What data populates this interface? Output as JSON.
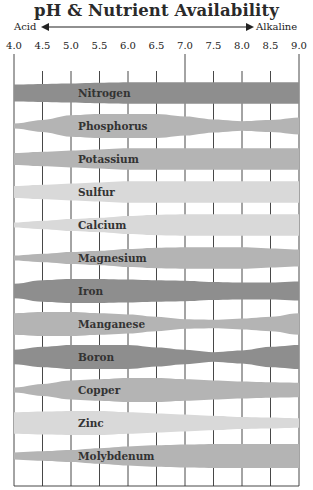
{
  "title": "pH & Nutrient Availability",
  "axis": {
    "left_label": "Acid",
    "right_label": "Alkaline",
    "ticks": [
      "4.0",
      "4.5",
      "5.0",
      "5.5",
      "6.0",
      "6.5",
      "7.0",
      "7.5",
      "8.0",
      "8.5",
      "9.0"
    ]
  },
  "colors": {
    "dark": "#8e8e8e",
    "medium": "#b4b4b4",
    "light": "#d9d9d9",
    "grid": "#333333"
  },
  "chart_data": {
    "type": "area",
    "title": "pH & Nutrient Availability",
    "xlabel": "pH (Acid ← → Alkaline)",
    "x_ticks": [
      4.0,
      4.5,
      5.0,
      5.5,
      6.0,
      6.5,
      7.0,
      7.5,
      8.0,
      8.5,
      9.0
    ],
    "xlim": [
      4.0,
      9.0
    ],
    "grid": true,
    "x": [
      4.0,
      4.5,
      5.0,
      5.5,
      6.0,
      6.5,
      7.0,
      7.5,
      8.0,
      8.5,
      9.0
    ],
    "series": [
      {
        "name": "Nitrogen",
        "shade": "dark",
        "values": [
          0.7,
          0.75,
          0.8,
          0.85,
          0.9,
          0.9,
          0.9,
          0.9,
          0.9,
          0.9,
          0.9
        ]
      },
      {
        "name": "Phosphorus",
        "shade": "medium",
        "values": [
          0.2,
          0.5,
          0.9,
          1.0,
          1.0,
          1.0,
          0.8,
          0.55,
          0.4,
          0.5,
          0.7
        ]
      },
      {
        "name": "Potassium",
        "shade": "medium",
        "values": [
          0.5,
          0.6,
          0.7,
          0.8,
          0.9,
          0.9,
          0.9,
          0.9,
          0.9,
          0.9,
          0.9
        ]
      },
      {
        "name": "Sulfur",
        "shade": "light",
        "values": [
          0.5,
          0.6,
          0.7,
          0.8,
          0.9,
          0.9,
          0.9,
          0.9,
          0.9,
          0.9,
          0.9
        ]
      },
      {
        "name": "Calcium",
        "shade": "light",
        "values": [
          0.2,
          0.35,
          0.5,
          0.6,
          0.75,
          0.85,
          0.9,
          0.9,
          0.9,
          0.9,
          0.9
        ]
      },
      {
        "name": "Magnesium",
        "shade": "medium",
        "values": [
          0.2,
          0.35,
          0.5,
          0.6,
          0.75,
          0.85,
          0.9,
          0.9,
          0.9,
          0.8,
          0.7
        ]
      },
      {
        "name": "Iron",
        "shade": "dark",
        "values": [
          0.6,
          0.9,
          1.0,
          1.0,
          0.95,
          0.9,
          0.85,
          0.75,
          0.7,
          0.7,
          0.8
        ]
      },
      {
        "name": "Manganese",
        "shade": "medium",
        "values": [
          0.9,
          1.0,
          1.0,
          0.9,
          0.8,
          0.6,
          0.4,
          0.35,
          0.45,
          0.6,
          0.9
        ]
      },
      {
        "name": "Boron",
        "shade": "dark",
        "values": [
          0.6,
          0.85,
          1.0,
          1.0,
          1.0,
          0.8,
          0.6,
          0.4,
          0.55,
          0.85,
          1.0
        ]
      },
      {
        "name": "Copper",
        "shade": "medium",
        "values": [
          0.2,
          0.5,
          0.8,
          0.9,
          1.0,
          1.0,
          0.9,
          0.8,
          0.7,
          0.65,
          0.6
        ]
      },
      {
        "name": "Zinc",
        "shade": "light",
        "values": [
          0.9,
          0.95,
          1.0,
          1.0,
          0.9,
          0.8,
          0.7,
          0.6,
          0.5,
          0.45,
          0.4
        ]
      },
      {
        "name": "Molybdenum",
        "shade": "medium",
        "values": [
          0.3,
          0.4,
          0.5,
          0.65,
          0.8,
          0.9,
          0.95,
          1.0,
          1.0,
          1.0,
          1.0
        ]
      }
    ]
  }
}
